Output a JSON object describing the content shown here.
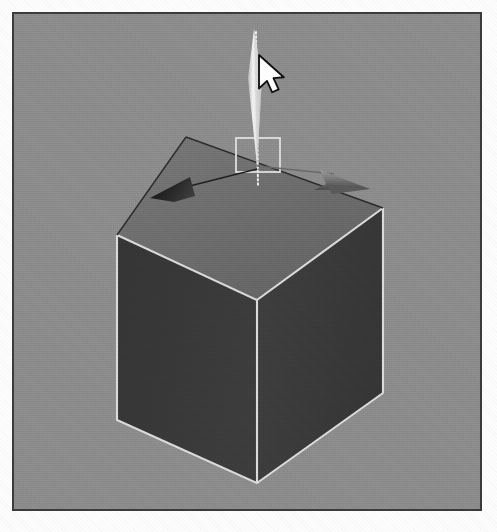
{
  "app": {
    "title": "3D Modeling Viewport",
    "viewport_label": "Perspective viewport",
    "background_color": "#8d8d8d",
    "border_color": "#3b3b3b",
    "page_color": "#fdfdfd"
  },
  "scene": {
    "object_name": "Box",
    "object_type": "cube",
    "shading_mode": "smooth-shaded",
    "face_top_color": "#6f6f6f",
    "face_left_color": "#383838",
    "face_right_color": "#3e3e3e",
    "edge_highlight_color": "#d8d8d8",
    "edge_dark_color": "#2a2a2a",
    "geometry": {
      "top_back_vertex": [
        186,
        137
      ],
      "top_left_vertex": [
        117,
        235
      ],
      "top_front_vertex": [
        257,
        300
      ],
      "top_right_vertex": [
        383,
        208
      ],
      "bottom_left_vertex": [
        117,
        420
      ],
      "bottom_front_vertex": [
        257,
        483
      ],
      "bottom_right_vertex": [
        383,
        393
      ]
    }
  },
  "gizmo": {
    "name": "move-gizmo",
    "tool": "Move",
    "origin": [
      257,
      168
    ],
    "axes": [
      {
        "name": "z-axis-handle",
        "label": "Z",
        "color": "#e9e9e9",
        "state": "highlighted",
        "direction": "up",
        "tip": [
          253,
          26
        ],
        "base": [
          257,
          168
        ]
      },
      {
        "name": "x-axis-handle",
        "label": "X",
        "color": "#1f1f1f",
        "state": "normal",
        "direction": "left-down",
        "tip": [
          155,
          192
        ],
        "base": [
          257,
          168
        ]
      },
      {
        "name": "y-axis-handle",
        "label": "Y",
        "color": "#6a6a6a",
        "state": "normal",
        "direction": "right-up",
        "tip": [
          348,
          183
        ],
        "base": [
          257,
          168
        ]
      }
    ],
    "plane_handle": {
      "name": "xy-plane-handle",
      "color": "#dedede",
      "rect": [
        236,
        138,
        44,
        34
      ]
    },
    "constraint_line": {
      "name": "axis-constraint-line",
      "style": "dotted",
      "color": "#efefef",
      "from": [
        256,
        32
      ],
      "to": [
        258,
        184
      ]
    }
  },
  "cursor": {
    "name": "mouse-cursor",
    "type": "arrow-pointer",
    "position": [
      262,
      58
    ],
    "fill_color": "#ffffff",
    "outline_color": "#111111"
  }
}
